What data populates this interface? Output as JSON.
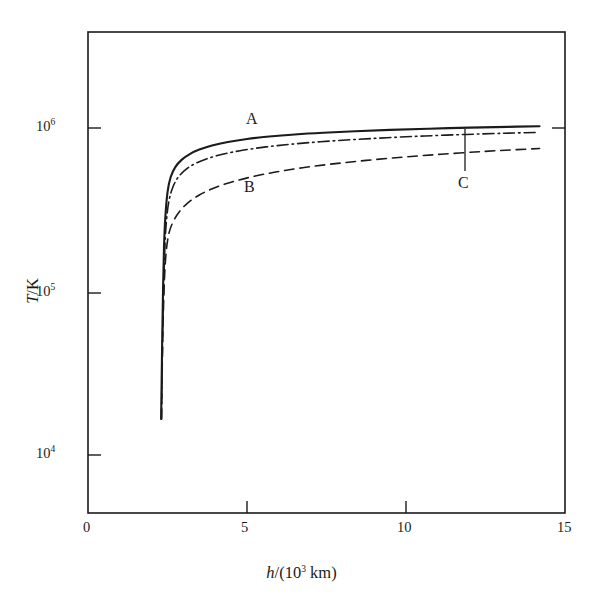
{
  "figure": {
    "type": "scientific-line-chart",
    "background": "#ffffff",
    "ink_color": "#1b1b1b"
  },
  "axes": {
    "x": {
      "title_prefix": "h",
      "title_suffix": "/(10",
      "title_exp": "3",
      "title_tail": " km)",
      "title_full": "h/(10³ km)",
      "ticks": [
        {
          "label": "0",
          "value": 0
        },
        {
          "label": "5",
          "value": 5
        },
        {
          "label": "10",
          "value": 10
        },
        {
          "label": "15",
          "value": 15
        }
      ],
      "min": 0,
      "max": 15
    },
    "y": {
      "title_prefix": "T",
      "title_suffix": "/K",
      "title_full": "T/K",
      "scale": "log",
      "ticks": [
        {
          "mantissa": "10",
          "exponent": "6",
          "value": 1000000
        },
        {
          "mantissa": "10",
          "exponent": "5",
          "value": 100000
        },
        {
          "mantissa": "10",
          "exponent": "4",
          "value": 10000
        }
      ],
      "min": 3500,
      "max": 4200000
    }
  },
  "curve_labels": [
    {
      "id": "A",
      "text": "A",
      "style": "solid"
    },
    {
      "id": "B",
      "text": "B",
      "style": "dashed"
    },
    {
      "id": "C",
      "text": "C",
      "style": "dash-dot"
    }
  ],
  "chart_data": {
    "type": "line",
    "title": "",
    "xlabel": "h/(10³ km)",
    "ylabel": "T/K",
    "xlim": [
      0,
      15
    ],
    "ylim": [
      3500,
      4200000
    ],
    "yscale": "log",
    "grid": false,
    "legend": "inline-curve-labels",
    "annotations": [
      {
        "text": "A",
        "x": 5.05,
        "y": 1150000,
        "target_curve": "A"
      },
      {
        "text": "B",
        "x": 4.95,
        "y": 470000,
        "target_curve": "B"
      },
      {
        "text": "C",
        "x": 11.6,
        "y": 510000,
        "target_curve": "C",
        "leader_line": {
          "x": 11.85,
          "y_top": 980000,
          "y_bottom": 600000
        }
      }
    ],
    "series": [
      {
        "name": "A",
        "style": "solid",
        "points": [
          [
            2.3,
            14000
          ],
          [
            2.33,
            40000
          ],
          [
            2.36,
            95000
          ],
          [
            2.39,
            175000
          ],
          [
            2.43,
            270000
          ],
          [
            2.5,
            395000
          ],
          [
            2.6,
            495000
          ],
          [
            2.75,
            575000
          ],
          [
            2.95,
            640000
          ],
          [
            3.2,
            695000
          ],
          [
            3.5,
            742000
          ],
          [
            3.9,
            788000
          ],
          [
            4.4,
            830000
          ],
          [
            5.0,
            868000
          ],
          [
            5.7,
            900000
          ],
          [
            6.5,
            928000
          ],
          [
            7.4,
            952000
          ],
          [
            8.4,
            973000
          ],
          [
            9.5,
            992000
          ],
          [
            10.7,
            1010000
          ],
          [
            12.0,
            1026000
          ],
          [
            13.2,
            1038000
          ],
          [
            14.2,
            1048000
          ]
        ]
      },
      {
        "name": "C",
        "style": "dash-dot",
        "points": [
          [
            2.31,
            14000
          ],
          [
            2.34,
            42000
          ],
          [
            2.38,
            100000
          ],
          [
            2.42,
            180000
          ],
          [
            2.47,
            265000
          ],
          [
            2.55,
            352000
          ],
          [
            2.68,
            432000
          ],
          [
            2.85,
            498000
          ],
          [
            3.1,
            558000
          ],
          [
            3.4,
            608000
          ],
          [
            3.8,
            655000
          ],
          [
            4.3,
            698000
          ],
          [
            4.9,
            737000
          ],
          [
            5.6,
            772000
          ],
          [
            6.4,
            804000
          ],
          [
            7.3,
            833000
          ],
          [
            8.3,
            859000
          ],
          [
            9.4,
            884000
          ],
          [
            10.6,
            907000
          ],
          [
            11.9,
            928000
          ],
          [
            13.1,
            944000
          ],
          [
            14.1,
            956000
          ]
        ]
      },
      {
        "name": "B",
        "style": "dashed",
        "points": [
          [
            2.31,
            14000
          ],
          [
            2.35,
            45000
          ],
          [
            2.4,
            105000
          ],
          [
            2.46,
            165000
          ],
          [
            2.55,
            218000
          ],
          [
            2.7,
            262000
          ],
          [
            2.9,
            302000
          ],
          [
            3.15,
            340000
          ],
          [
            3.5,
            380000
          ],
          [
            3.95,
            420000
          ],
          [
            4.5,
            459000
          ],
          [
            5.15,
            497000
          ],
          [
            5.9,
            533000
          ],
          [
            6.75,
            568000
          ],
          [
            7.7,
            601000
          ],
          [
            8.75,
            633000
          ],
          [
            9.9,
            664000
          ],
          [
            11.1,
            693000
          ],
          [
            12.4,
            721000
          ],
          [
            13.5,
            742000
          ],
          [
            14.2,
            754000
          ]
        ]
      }
    ]
  }
}
